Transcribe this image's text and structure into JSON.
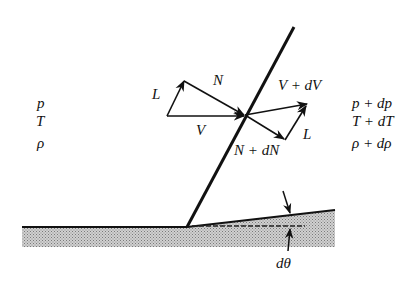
{
  "diagram": {
    "upstream_state": {
      "pressure": "p",
      "temperature": "T",
      "density": "ρ"
    },
    "downstream_state": {
      "pressure": "p + dp",
      "temperature": "T + dT",
      "density": "ρ + dρ"
    },
    "upstream_vectors": {
      "velocity": "V",
      "tangential": "L",
      "normal": "N"
    },
    "downstream_vectors": {
      "velocity": "V + dV",
      "tangential": "L",
      "normal": "N + dN"
    },
    "deflection_angle": "dθ",
    "colors": {
      "line": "#111111",
      "wall_fill": "#b8b8b8"
    }
  }
}
